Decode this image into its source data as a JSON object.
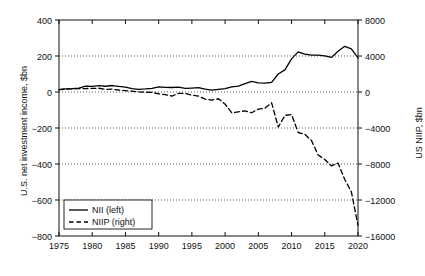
{
  "chart_data": {
    "type": "line",
    "title": "",
    "xlabel": "",
    "ylabel": "U.S. net investment income, $bn",
    "ylabel_right": "US NIIP, $bn",
    "xlim": [
      1975,
      2020
    ],
    "ylim": [
      -800,
      400
    ],
    "ylim_right": [
      -16000,
      8000
    ],
    "xticks": [
      1975,
      1980,
      1985,
      1990,
      1995,
      2000,
      2005,
      2010,
      2015,
      2020
    ],
    "yticks_left": [
      400,
      200,
      0,
      -200,
      -400,
      -600,
      -800
    ],
    "yticks_right": [
      8000,
      4000,
      0,
      -4000,
      -8000,
      -12000,
      -16000
    ],
    "grid": "horizontal-dotted",
    "legend_position": "bottom-left",
    "x": [
      1975,
      1976,
      1977,
      1978,
      1979,
      1980,
      1981,
      1982,
      1983,
      1984,
      1985,
      1986,
      1987,
      1988,
      1989,
      1990,
      1991,
      1992,
      1993,
      1994,
      1995,
      1996,
      1997,
      1998,
      1999,
      2000,
      2001,
      2002,
      2003,
      2004,
      2005,
      2006,
      2007,
      2008,
      2009,
      2010,
      2011,
      2012,
      2013,
      2014,
      2015,
      2016,
      2017,
      2018,
      2019,
      2020
    ],
    "series": [
      {
        "name": "NII (left)",
        "axis": "left",
        "style": "solid",
        "color": "#000000",
        "units": "$bn",
        "values": [
          13,
          17,
          19,
          22,
          33,
          31,
          35,
          32,
          36,
          31,
          27,
          19,
          15,
          17,
          20,
          29,
          26,
          25,
          27,
          20,
          22,
          24,
          16,
          10,
          15,
          19,
          29,
          33,
          47,
          59,
          51,
          49,
          53,
          100,
          123,
          184,
          223,
          211,
          205,
          205,
          201,
          192,
          226,
          254,
          240,
          190
        ]
      },
      {
        "name": "NIIP (right)",
        "axis": "right",
        "style": "dashed",
        "color": "#000000",
        "units": "$bn",
        "values": [
          255,
          320,
          350,
          380,
          380,
          400,
          420,
          300,
          310,
          220,
          160,
          90,
          20,
          -20,
          -50,
          -200,
          -300,
          -450,
          -150,
          -170,
          -350,
          -450,
          -800,
          -900,
          -750,
          -1350,
          -2300,
          -2200,
          -2100,
          -2300,
          -1900,
          -1800,
          -1200,
          -3900,
          -2600,
          -2500,
          -4500,
          -4700,
          -5400,
          -7000,
          -7500,
          -8200,
          -7900,
          -9700,
          -11100,
          -14800
        ]
      }
    ],
    "legend": [
      {
        "label": "NII (left)",
        "style": "solid"
      },
      {
        "label": "NIIP (right)",
        "style": "dashed"
      }
    ]
  }
}
